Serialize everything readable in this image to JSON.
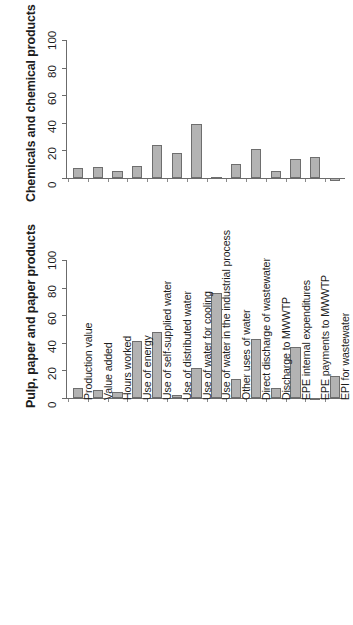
{
  "chart_data": [
    {
      "type": "bar",
      "panel": "top",
      "title": "",
      "ylabel": "Chemicals and chemical products",
      "xlabel": "",
      "ylim": [
        -5,
        105
      ],
      "yticks": [
        0,
        20,
        40,
        60,
        80,
        100
      ],
      "ytick_labels": [
        "0",
        "20",
        "40",
        "60",
        "80",
        "100"
      ],
      "grid": false,
      "legend": null,
      "bar_color": "#b3b3b3",
      "bar_edge_color": "#6e6e6e",
      "categories": [
        "Production value",
        "Value added",
        "Hours worked",
        "Use of energy",
        "Use of self-supplied water",
        "Use of distributed water",
        "Use of water for cooling",
        "Use of water in the industrial process",
        "Other uses of water",
        "Direct discharge of wastewater",
        "Discharge to MWWTP",
        "EPE internal expenditures",
        "EPE payments to MWWTP",
        "EPI for wastewater"
      ],
      "values": [
        7,
        8,
        5,
        9,
        24,
        18,
        39,
        1,
        10,
        21,
        5,
        14,
        15,
        -2
      ]
    },
    {
      "type": "bar",
      "panel": "bottom",
      "title": "",
      "ylabel": "Pulp, paper and paper products",
      "xlabel": "",
      "ylim": [
        -5,
        105
      ],
      "yticks": [
        0,
        20,
        40,
        60,
        80,
        100
      ],
      "ytick_labels": [
        "0",
        "20",
        "40",
        "60",
        "80",
        "100"
      ],
      "grid": false,
      "legend": null,
      "bar_color": "#b3b3b3",
      "bar_edge_color": "#6e6e6e",
      "categories": [
        "Production value",
        "Value added",
        "Hours worked",
        "Use of energy",
        "Use of self-supplied water",
        "Use of distributed water",
        "Use of water for cooling",
        "Use of water in the industrial process",
        "Other uses of water",
        "Direct discharge of wastewater",
        "Discharge to MWWTP",
        "EPE internal expenditures",
        "EPE payments to MWWTP",
        "EPI for wastewater"
      ],
      "values": [
        7.5,
        6,
        4,
        41,
        48,
        2,
        22,
        76,
        14,
        43,
        7,
        37,
        -1.5,
        16
      ]
    }
  ],
  "panels": {
    "top": {
      "axis_title": "Chemicals and chemical products"
    },
    "bottom": {
      "axis_title": "Pulp, paper and paper products"
    }
  },
  "xaxis": {
    "labels": [
      "Production value",
      "Value added",
      "Hours worked",
      "Use of energy",
      "Use of self-supplied water",
      "Use of distributed water",
      "Use of water for cooling",
      "Use of water in the industrial process",
      "Other uses of water",
      "Direct discharge of wastewater",
      "Discharge to MWWTP",
      "EPE internal expenditures",
      "EPE payments to MWWTP",
      "EPI for wastewater"
    ]
  },
  "yaxis": {
    "tick_labels": [
      "0",
      "20",
      "40",
      "60",
      "80",
      "100"
    ]
  }
}
